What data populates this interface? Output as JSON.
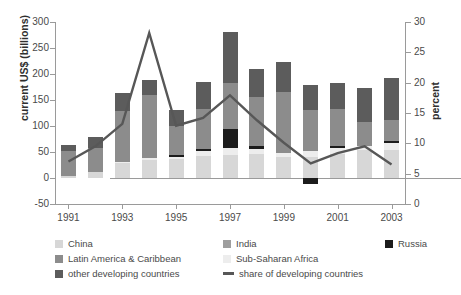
{
  "chart_data": {
    "type": "bar",
    "title": "",
    "subtitle": "",
    "xlabel": "",
    "ylabel": "current US$ (billions)",
    "y2label": "percent",
    "categories": [
      1991,
      1992,
      1993,
      1994,
      1995,
      1996,
      1997,
      1998,
      1999,
      2000,
      2001,
      2002,
      2003
    ],
    "tick_labels_x": [
      "1991",
      "1993",
      "1995",
      "1997",
      "1999",
      "2001",
      "2003"
    ],
    "tick_labels_y_left": [
      "300",
      "250",
      "200",
      "150",
      "100",
      "50",
      "0",
      "-50"
    ],
    "tick_labels_y_right": [
      "30",
      "25",
      "20",
      "15",
      "10",
      "5",
      "0"
    ],
    "ylim": [
      -50,
      300
    ],
    "y2lim": [
      0,
      30
    ],
    "grid": false,
    "legend_position": "bottom",
    "stacked": true,
    "series": [
      {
        "name": "China",
        "color": "#d7d7d7",
        "values": [
          4,
          11,
          28,
          34,
          36,
          42,
          45,
          46,
          40,
          41,
          47,
          53,
          54
        ]
      },
      {
        "name": "Latin America & Caribbean",
        "color": "#8c8c8c",
        "values": [
          47,
          46,
          98,
          120,
          56,
          76,
          88,
          93,
          116,
          78,
          72,
          46,
          40
        ]
      },
      {
        "name": "Russia",
        "color": "#1c1c1c",
        "values": [
          0,
          0,
          0,
          0,
          3,
          5,
          37,
          7,
          0,
          -12,
          4,
          0,
          4
        ]
      },
      {
        "name": "Sub-Saharan Africa",
        "color": "#ededed",
        "values": [
          0,
          0,
          3,
          5,
          5,
          9,
          13,
          9,
          9,
          11,
          10,
          9,
          13
        ]
      },
      {
        "name": "India",
        "color": "#9e9e9e",
        "values": [
          0,
          0,
          0,
          0,
          0,
          0,
          0,
          0,
          0,
          0,
          0,
          0,
          0
        ]
      },
      {
        "name": "other developing countries",
        "color": "#5c5c5c",
        "values": [
          13,
          21,
          34,
          29,
          31,
          53,
          97,
          54,
          58,
          49,
          49,
          66,
          82
        ]
      }
    ],
    "line_series": {
      "name": "share of developing countries",
      "color": "#575757",
      "axis": "right",
      "values": [
        7.0,
        9.5,
        13.2,
        28.2,
        12.9,
        14.2,
        17.9,
        13.8,
        10.1,
        6.7,
        8.4,
        9.5,
        6.5
      ]
    }
  },
  "axes": {
    "left_title": "current US$ (billions)",
    "right_title": "percent",
    "y_left_ticks": [
      "300",
      "250",
      "200",
      "150",
      "100",
      "50",
      "0",
      "-50"
    ],
    "y_right_ticks": [
      "30",
      "25",
      "20",
      "15",
      "10",
      "5",
      "0"
    ],
    "x_ticks": [
      "1991",
      "1993",
      "1995",
      "1997",
      "1999",
      "2001",
      "2003"
    ]
  },
  "legend": {
    "items": [
      {
        "label": "China",
        "color": "#d7d7d7",
        "type": "swatch"
      },
      {
        "label": "India",
        "color": "#9e9e9e",
        "type": "swatch"
      },
      {
        "label": "Russia",
        "color": "#1c1c1c",
        "type": "swatch"
      },
      {
        "label": "Latin America & Caribbean",
        "color": "#8c8c8c",
        "type": "swatch"
      },
      {
        "label": "Sub-Saharan Africa",
        "color": "#ededed",
        "type": "swatch"
      },
      {
        "label": "other developing countries",
        "color": "#5c5c5c",
        "type": "swatch"
      },
      {
        "label": "share of developing countries",
        "color": "#575757",
        "type": "line"
      }
    ]
  }
}
